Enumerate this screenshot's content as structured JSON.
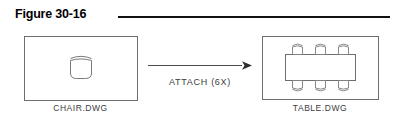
{
  "figure": {
    "title": "Figure 30-16",
    "rule_color": "#111111"
  },
  "diagram": {
    "type": "cad-block-attach-illustration",
    "line_color": "#6e6e6e",
    "arrow_color": "#4a4a4a",
    "source": {
      "caption": "CHAIR.DWG",
      "content_description": "single chair symbol, plan view",
      "chair_count": 1
    },
    "operation": {
      "label": "ATTACH  (6X)",
      "command": "ATTACH",
      "multiplier": "6X",
      "direction": "left-to-right"
    },
    "target": {
      "caption": "TABLE.DWG",
      "content_description": "rectangular table with six chairs, plan view",
      "chair_count": 6,
      "chairs_top_row": 3,
      "chairs_bottom_row": 3
    }
  }
}
